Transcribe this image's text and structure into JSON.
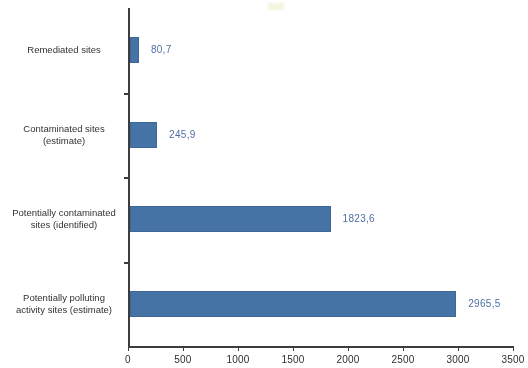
{
  "chart_data": {
    "type": "bar",
    "orientation": "horizontal",
    "title": "",
    "subtitle": "",
    "xlabel": "",
    "ylabel": "",
    "categories": [
      "Remediated sites",
      "Contaminated sites\n(estimate)",
      "Potentially contaminated\nsites (identified)",
      "Potentially polluting\nactivity sites (estimate)"
    ],
    "values": [
      80.7,
      245.9,
      1823.6,
      2965.5
    ],
    "value_labels": [
      "80,7",
      "245,9",
      "1823,6",
      "2965,5"
    ],
    "xlim": [
      0,
      3500
    ],
    "xticks": [
      0,
      500,
      1000,
      1500,
      2000,
      2500,
      3000,
      3500
    ],
    "xtick_labels": [
      "0",
      "500",
      "1000",
      "1500",
      "2000",
      "2500",
      "3000",
      "3500"
    ],
    "grid": false,
    "legend": false,
    "decimal_separator": ",",
    "colors": {
      "bar": "#4472a8",
      "bar_border": "#3b6598",
      "value_label": "#4a6fa5",
      "axis": "#3a3a3a",
      "tick_label": "#2b2b2b",
      "category_label": "#2f2f2f",
      "background": "#ffffff"
    }
  }
}
